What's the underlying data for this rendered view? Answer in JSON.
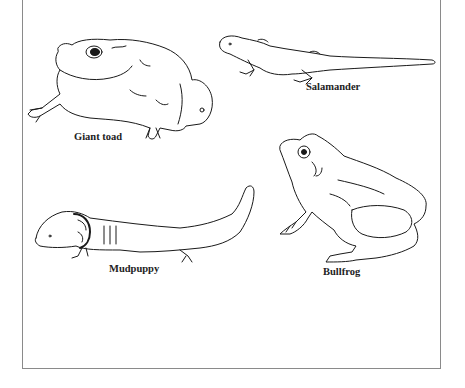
{
  "figure": {
    "animals": [
      {
        "id": "giant-toad",
        "label": "Giant toad"
      },
      {
        "id": "salamander",
        "label": "Salamander"
      },
      {
        "id": "mudpuppy",
        "label": "Mudpuppy"
      },
      {
        "id": "bullfrog",
        "label": "Bullfrog"
      }
    ],
    "colors": {
      "line": "#1a1a1a",
      "border": "#8a8a8a",
      "background": "#ffffff"
    }
  }
}
